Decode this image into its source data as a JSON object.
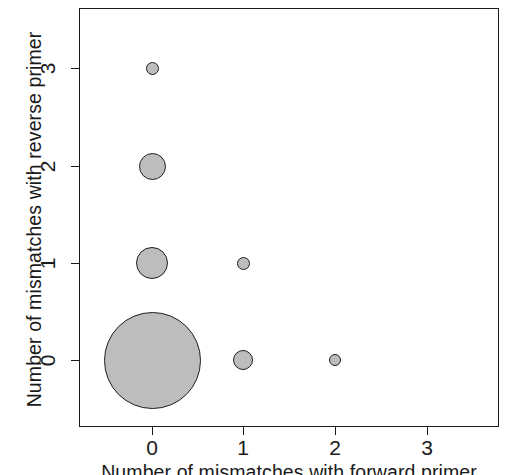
{
  "chart_data": {
    "type": "scatter",
    "variant": "bubble",
    "title": "",
    "xlabel": "Number of mismatches with forward primer",
    "ylabel": "Number of mismatches with reverse primer",
    "xlim": [
      -0.55,
      3.6
    ],
    "ylim": [
      -0.55,
      3.55
    ],
    "xticks": [
      0,
      1,
      2,
      3
    ],
    "yticks": [
      0,
      1,
      2,
      3
    ],
    "xticklabels": [
      "0",
      "1",
      "2",
      "3"
    ],
    "yticklabels": [
      "0",
      "1",
      "2",
      "3"
    ],
    "grid": false,
    "legend": false,
    "marker_fill": "#bdbdbd",
    "marker_edge": "#1f1f1f",
    "axis_color": "#1a1a1a",
    "background": "#ffffff",
    "size_encoding": "bubble area proportional to count",
    "points": [
      {
        "x": 0,
        "y": 0,
        "size_px": 97,
        "rank": 1
      },
      {
        "x": 0,
        "y": 1,
        "size_px": 32,
        "rank": 2
      },
      {
        "x": 0,
        "y": 2,
        "size_px": 27,
        "rank": 3
      },
      {
        "x": 0,
        "y": 3,
        "size_px": 13,
        "rank": 6
      },
      {
        "x": 1,
        "y": 0,
        "size_px": 20,
        "rank": 4
      },
      {
        "x": 1,
        "y": 1,
        "size_px": 13,
        "rank": 5
      },
      {
        "x": 2,
        "y": 0,
        "size_px": 12,
        "rank": 7
      }
    ]
  },
  "plot": {
    "frame": {
      "left": 79,
      "top": 8,
      "width": 420,
      "height": 419
    },
    "x_pixels": [
      152,
      243,
      335,
      427
    ],
    "y_pixels": [
      360,
      263,
      166,
      68
    ]
  }
}
